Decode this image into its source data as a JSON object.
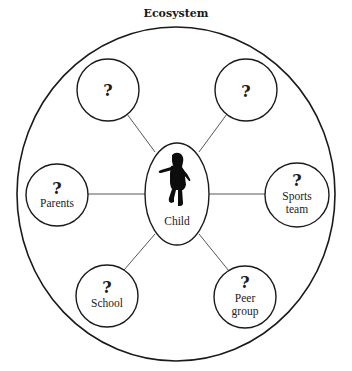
{
  "title": "Ecosystem",
  "center": {
    "label": "Child",
    "icon": "child-silhouette-icon"
  },
  "nodes": [
    {
      "id": "top-left",
      "mark": "?",
      "label": ""
    },
    {
      "id": "top-right",
      "mark": "?",
      "label": ""
    },
    {
      "id": "parents",
      "mark": "?",
      "label": "Parents"
    },
    {
      "id": "sports-team",
      "mark": "?",
      "label_lines": [
        "Sports",
        "team"
      ]
    },
    {
      "id": "school",
      "mark": "?",
      "label": "School"
    },
    {
      "id": "peer-group",
      "mark": "?",
      "label_lines": [
        "Peer",
        "group"
      ]
    }
  ],
  "colors": {
    "stroke": "#1a1a1a",
    "background": "#ffffff"
  }
}
